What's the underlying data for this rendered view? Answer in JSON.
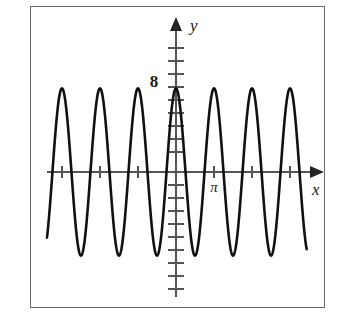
{
  "figure": {
    "title": "",
    "background_color": "#ffffff",
    "border_color": "#6d6d6d",
    "curve_color": "#111111",
    "axis_color": "#555555"
  },
  "axes": {
    "x_label": "x",
    "y_label": "y",
    "x_axis_name": "x-axis",
    "y_axis_name": "y-axis"
  },
  "labels": {
    "y_value_label": "8",
    "x_tick_label_pi": "π"
  },
  "chart_data": {
    "type": "line",
    "title": "",
    "xlabel": "x",
    "ylabel": "y",
    "grid": false,
    "legend": "none",
    "function": "y = 8 cos(6x)",
    "amplitude": 8,
    "period": 1.0472,
    "xlim": [
      -3.6,
      3.6
    ],
    "ylim": [
      -14,
      11
    ],
    "y_tick_labels": [
      "8"
    ],
    "y_tick_values": [
      8
    ],
    "x_tick_labels": [
      "π"
    ],
    "x_tick_values": [
      3.14159
    ],
    "x_tick_spacing": 0.5236,
    "y_tick_spacing": 1,
    "x": [
      -3.6,
      -3.5,
      -3.4,
      -3.3,
      -3.2,
      -3.1,
      -3.0,
      -2.9,
      -2.8,
      -2.7,
      -2.6,
      -2.5,
      -2.4,
      -2.3,
      -2.2,
      -2.1,
      -2.0,
      -1.9,
      -1.8,
      -1.7,
      -1.6,
      -1.5,
      -1.4,
      -1.3,
      -1.2,
      -1.1,
      -1.0,
      -0.9,
      -0.8,
      -0.7,
      -0.6,
      -0.5,
      -0.4,
      -0.3,
      -0.2,
      -0.1,
      0.0,
      0.1,
      0.2,
      0.3,
      0.4,
      0.5,
      0.6,
      0.7,
      0.8,
      0.9,
      1.0,
      1.1,
      1.2,
      1.3,
      1.4,
      1.5,
      1.6,
      1.7,
      1.8,
      1.9,
      2.0,
      2.1,
      2.2,
      2.3,
      2.4,
      2.5,
      2.6,
      2.7,
      2.8,
      2.9,
      3.0,
      3.1,
      3.2,
      3.3,
      3.4,
      3.5,
      3.6
    ],
    "y": [
      -3.1,
      1.3,
      5.4,
      7.8,
      7.9,
      5.7,
      2.0,
      -2.1,
      -5.8,
      -7.9,
      -7.8,
      -5.3,
      -1.2,
      3.0,
      6.4,
      8.0,
      7.0,
      4.0,
      -0.2,
      -4.2,
      -7.1,
      -8.0,
      -6.6,
      -3.4,
      0.8,
      4.8,
      7.5,
      7.9,
      5.9,
      2.3,
      -1.9,
      -5.6,
      -7.8,
      -7.9,
      -5.5,
      -1.5,
      2.7,
      6.3,
      8.0,
      7.1,
      4.3,
      0.1,
      -4.0,
      -7.0,
      -8.0,
      -6.7,
      -3.6,
      0.6,
      4.6,
      7.4,
      8.0,
      6.1,
      2.5,
      -1.7,
      -5.5,
      -7.8,
      -7.9,
      -5.6,
      -1.7,
      2.5,
      6.1,
      8.0,
      7.2,
      4.4,
      0.3,
      -3.8,
      -6.9,
      -8.0,
      -6.8,
      -3.8,
      0.4,
      4.4,
      7.3
    ]
  }
}
